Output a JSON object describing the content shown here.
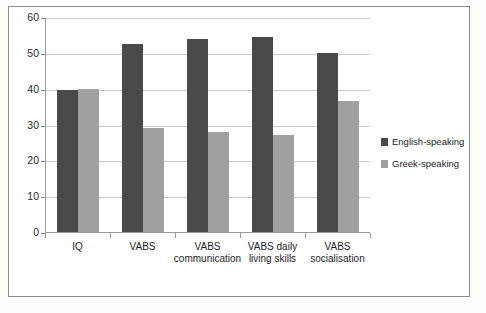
{
  "chart_data": {
    "type": "bar",
    "title": "",
    "xlabel": "",
    "ylabel": "",
    "ylim": [
      0,
      60
    ],
    "yticks": [
      "0",
      "10",
      "20",
      "30",
      "40",
      "50",
      "60"
    ],
    "grid": true,
    "legend_position": "right",
    "categories": [
      "IQ",
      "VABS",
      "VABS communication",
      "VABS daily living skills",
      "VABS socialisation"
    ],
    "series": [
      {
        "name": "English-speaking",
        "color": "#4a4a4a",
        "values": [
          39.5,
          52.5,
          54,
          54.5,
          50
        ]
      },
      {
        "name": "Greek-speaking",
        "color": "#a0a0a0",
        "values": [
          40,
          29,
          28,
          27,
          36.5
        ]
      }
    ]
  },
  "legend": {
    "items": [
      {
        "label": "English-speaking"
      },
      {
        "label": "Greek-speaking"
      }
    ]
  }
}
